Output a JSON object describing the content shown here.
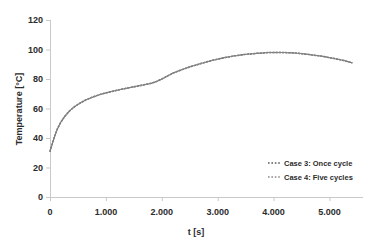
{
  "chart_data": {
    "type": "line",
    "title": "",
    "xlabel": "t [s]",
    "ylabel": "Temperature [°C]",
    "xlim": [
      0,
      5600
    ],
    "ylim": [
      0,
      120
    ],
    "xticks": [
      0,
      1000,
      2000,
      3000,
      4000,
      5000
    ],
    "xtick_labels": [
      "0",
      "1.000",
      "2.000",
      "3.000",
      "4.000",
      "5.000"
    ],
    "yticks": [
      0,
      20,
      40,
      60,
      80,
      100,
      120
    ],
    "ytick_labels": [
      "0",
      "20",
      "40",
      "60",
      "80",
      "100",
      "120"
    ],
    "grid": false,
    "legend_position": "lower right",
    "line_style": "dotted",
    "series": [
      {
        "name": "Case 3: Once cycle",
        "color": "#595959",
        "x": [
          0,
          40,
          80,
          130,
          190,
          260,
          340,
          430,
          530,
          650,
          780,
          920,
          1080,
          1250,
          1430,
          1620,
          1800,
          1900,
          2000,
          2100,
          2200,
          2350,
          2500,
          2700,
          2900,
          3100,
          3300,
          3500,
          3700,
          3900,
          4100,
          4300,
          4500,
          4700,
          4900,
          5100,
          5250,
          5400
        ],
        "y": [
          31.0,
          36.0,
          41.0,
          46.0,
          50.5,
          54.5,
          58.0,
          61.0,
          63.5,
          66.0,
          68.0,
          69.8,
          71.3,
          72.8,
          74.2,
          75.6,
          77.0,
          78.2,
          80.0,
          82.0,
          84.0,
          86.2,
          88.2,
          90.5,
          92.6,
          94.3,
          95.7,
          96.7,
          97.4,
          97.9,
          98.0,
          97.8,
          97.2,
          96.3,
          95.2,
          93.8,
          92.6,
          91.0
        ]
      },
      {
        "name": "Case 4: Five cycles",
        "color": "#8c8c8c",
        "x": [
          0,
          40,
          80,
          130,
          190,
          260,
          340,
          430,
          530,
          650,
          780,
          920,
          1080,
          1250,
          1430,
          1620,
          1800,
          1900,
          2000,
          2100,
          2200,
          2350,
          2500,
          2700,
          2900,
          3100,
          3300,
          3500,
          3700,
          3900,
          4100,
          4300,
          4500,
          4700,
          4900,
          5100,
          5250,
          5400
        ],
        "y": [
          31.0,
          36.0,
          41.0,
          46.0,
          50.5,
          54.5,
          58.0,
          61.0,
          63.5,
          66.0,
          68.0,
          69.8,
          71.3,
          72.8,
          74.2,
          75.6,
          77.0,
          78.2,
          80.0,
          82.0,
          84.0,
          86.2,
          88.2,
          90.5,
          92.6,
          94.3,
          95.7,
          96.7,
          97.4,
          97.9,
          98.0,
          97.8,
          97.2,
          96.3,
          95.2,
          93.8,
          92.6,
          91.0
        ]
      }
    ]
  },
  "legend": {
    "entries": [
      {
        "label": "Case 3: Once cycle",
        "color": "#595959"
      },
      {
        "label": "Case 4: Five cycles",
        "color": "#8c8c8c"
      }
    ]
  },
  "axes": {
    "x_title": "t [s]",
    "y_title": "Temperature [°C]"
  }
}
